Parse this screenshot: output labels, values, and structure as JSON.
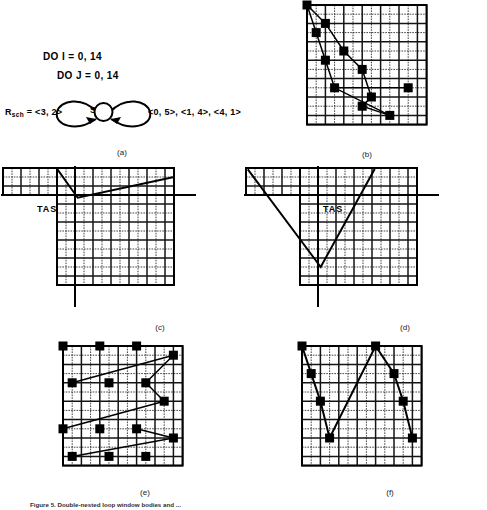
{
  "figure": {
    "caption": "Figure 5. Double-nested loop window bodies and ..."
  },
  "panel_a": {
    "label": "(a)",
    "code_lines": [
      "DO I = 0, 14",
      "DO J = 0, 14"
    ],
    "rsch_prefix": "R",
    "rsch_sub": "sch",
    "rsch_value": " = <3, 2>",
    "state_label": "S",
    "state_sub": "i",
    "vectors": "<0, 5>, <1, 4>, <4, 1>"
  },
  "panel_b": {
    "label": "(b)",
    "grid": {
      "cols": 13,
      "rows": 13
    },
    "markers": [
      [
        0,
        0
      ],
      [
        2,
        2
      ],
      [
        1,
        3
      ],
      [
        4,
        5
      ],
      [
        2,
        6
      ],
      [
        6,
        7
      ],
      [
        3,
        9
      ],
      [
        7,
        10
      ],
      [
        6,
        11
      ],
      [
        11,
        9
      ],
      [
        9,
        12
      ]
    ],
    "paths": [
      [
        [
          0,
          0
        ],
        [
          2,
          2
        ],
        [
          4,
          5
        ],
        [
          6,
          7
        ],
        [
          7,
          10
        ],
        [
          6,
          11
        ],
        [
          9,
          12
        ]
      ],
      [
        [
          0,
          0
        ],
        [
          1,
          3
        ],
        [
          2,
          6
        ],
        [
          3,
          9
        ],
        [
          9,
          12
        ]
      ],
      [
        [
          3,
          9
        ],
        [
          11,
          9
        ]
      ]
    ]
  },
  "panel_c": {
    "label": "(c)",
    "tas_label": "TAS",
    "grid": {
      "cols": 13,
      "rows": 13
    },
    "strip": {
      "cols": 6,
      "rows": 3
    },
    "path": [
      [
        6,
        0
      ],
      [
        6.2,
        2.3
      ],
      [
        13,
        0.6
      ]
    ]
  },
  "panel_d": {
    "label": "(d)",
    "tas_label": "TAS",
    "grid": {
      "cols": 13,
      "rows": 13
    },
    "strip": {
      "cols": 6,
      "rows": 3
    },
    "path": [
      [
        0,
        0
      ],
      [
        2.2,
        10.5
      ],
      [
        8.2,
        0
      ]
    ]
  },
  "panel_e": {
    "label": "(e)",
    "grid": {
      "cols": 13,
      "rows": 13
    },
    "markers": [
      [
        0,
        0
      ],
      [
        4,
        0
      ],
      [
        8,
        0
      ],
      [
        12,
        1
      ],
      [
        1,
        4
      ],
      [
        5,
        4
      ],
      [
        9,
        4
      ],
      [
        11,
        6
      ],
      [
        0,
        9
      ],
      [
        4,
        9
      ],
      [
        8,
        9
      ],
      [
        12,
        10
      ],
      [
        1,
        12
      ],
      [
        5,
        12
      ],
      [
        9,
        12
      ]
    ],
    "paths": [
      [
        [
          12,
          1
        ],
        [
          1,
          4
        ]
      ],
      [
        [
          12,
          1
        ],
        [
          9,
          4
        ]
      ],
      [
        [
          9,
          4
        ],
        [
          11,
          6
        ]
      ],
      [
        [
          11,
          6
        ],
        [
          0,
          9
        ]
      ],
      [
        [
          12,
          10
        ],
        [
          8,
          9
        ]
      ],
      [
        [
          12,
          10
        ],
        [
          1,
          12
        ]
      ]
    ]
  },
  "panel_f": {
    "label": "(f)",
    "grid": {
      "cols": 13,
      "rows": 13
    },
    "markers": [
      [
        0,
        0
      ],
      [
        1,
        3
      ],
      [
        2,
        6
      ],
      [
        3,
        10
      ],
      [
        8,
        0
      ],
      [
        10,
        3
      ],
      [
        11,
        6
      ],
      [
        12,
        10
      ]
    ],
    "paths": [
      [
        [
          0,
          0
        ],
        [
          1,
          3
        ],
        [
          2,
          6
        ],
        [
          3,
          10
        ],
        [
          8,
          0
        ],
        [
          10,
          3
        ],
        [
          11,
          6
        ],
        [
          12,
          10
        ]
      ]
    ]
  },
  "colors": {
    "ink": "#000000",
    "grid_line": "#1c1c1c",
    "paper": "#ffffff"
  }
}
